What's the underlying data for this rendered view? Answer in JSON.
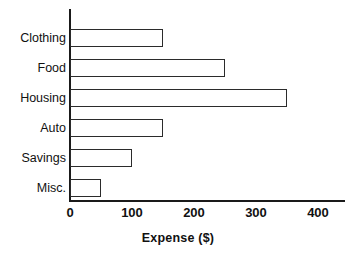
{
  "chart_data": {
    "type": "bar",
    "orientation": "horizontal",
    "title": "",
    "xlabel": "Expense ($)",
    "ylabel": "",
    "categories": [
      "Clothing",
      "Food",
      "Housing",
      "Auto",
      "Savings",
      "Misc."
    ],
    "values": [
      150,
      250,
      350,
      150,
      100,
      50
    ],
    "series": [
      {
        "name": "Expense",
        "values": [
          150,
          250,
          350,
          150,
          100,
          50
        ]
      }
    ],
    "xlim": [
      0,
      400
    ],
    "xticks": [
      0,
      100,
      200,
      300,
      400
    ],
    "xtick_labels": [
      "0",
      "100",
      "200",
      "300",
      "400"
    ],
    "grid": false,
    "legend": false,
    "bar_fill_color": "#ffffff",
    "bar_edge_color": "#2b2b2b",
    "axis_color": "#1a1a1a",
    "text_color": "#111111"
  }
}
